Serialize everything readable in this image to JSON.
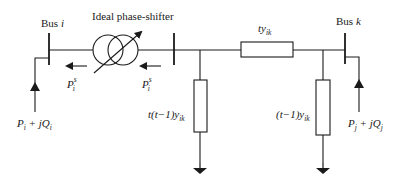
{
  "diagram": {
    "bus_i": {
      "label": "Bus ",
      "index": "i"
    },
    "bus_k": {
      "label": "Bus ",
      "index": "k"
    },
    "phase_shifter": {
      "label": "Ideal phase-shifter"
    },
    "series_admittance": {
      "base": "ty",
      "sub": "ik"
    },
    "shunt_left": {
      "prefix": "t(t−1)y",
      "sub": "ik"
    },
    "shunt_right": {
      "prefix": "(t−1)y",
      "sub": "ik"
    },
    "flow_left": {
      "base": "P",
      "sub": "i",
      "sup": "s"
    },
    "flow_right": {
      "base": "P",
      "sub": "i",
      "sup": "s"
    },
    "injection_i": {
      "p": "P",
      "p_sub": "i",
      "plus": " + j",
      "q": "Q",
      "q_sub": "i"
    },
    "injection_k": {
      "p": "P",
      "p_sub": "j",
      "plus": " + j",
      "q": "Q",
      "q_sub": "j"
    },
    "colors": {
      "line": "#1a1a1a",
      "background": "#ffffff"
    }
  }
}
